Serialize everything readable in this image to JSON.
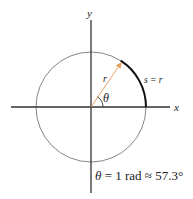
{
  "diagram": {
    "colors": {
      "axis": "#333333",
      "circle": "#777777",
      "arc": "#111111",
      "radius_arrow": "#e8a060",
      "text": "#222222"
    },
    "axes": {
      "x_label": "x",
      "y_label": "y"
    },
    "circle": {
      "center": [
        91,
        107
      ],
      "radius": 55
    },
    "radius_label": "r",
    "angle_label": "θ",
    "arc_label": "s = r",
    "caption": {
      "theta": "θ",
      "equation": " = 1 rad ≈ 57.3°"
    }
  }
}
